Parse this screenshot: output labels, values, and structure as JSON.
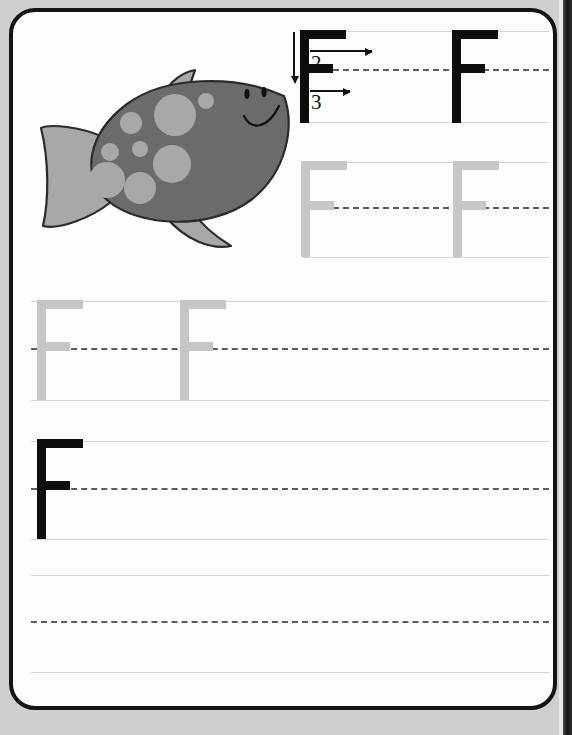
{
  "worksheet": {
    "letter": "F",
    "letter_case": "uppercase",
    "title": "Letter F tracing practice worksheet",
    "illustration": {
      "name": "fish",
      "body_color": "#6b6b6b",
      "fin_color": "#a8a8a8",
      "spot_color": "#a8a8a8",
      "outline_color": "#2b2b2b",
      "face": {
        "eyes": 2,
        "mouth": "smile"
      }
    },
    "colors": {
      "page_background": "#fdfdfd",
      "page_border": "#141414",
      "outer_background": "#cfcfcf",
      "guide_line": "#d4d4d4",
      "dashed_midline": "#5c5c5c",
      "trace_letter": "#c6c6c6",
      "model_letter": "#0d0d0d"
    },
    "stroke_order": {
      "label_1": "1",
      "label_2": "2",
      "label_3": "3",
      "stroke_1_direction": "down",
      "stroke_2_direction": "right",
      "stroke_3_direction": "right",
      "visible_numbers": [
        "2",
        "3"
      ]
    },
    "rows": [
      {
        "index": 1,
        "kind": "model",
        "top": 27,
        "mid": 65,
        "bottom": 118,
        "has_illustration_gap": true,
        "letters": [
          {
            "glyph": "F",
            "style": "black",
            "x": 296,
            "show_stroke_order": true
          },
          {
            "glyph": "F",
            "style": "black",
            "x": 448,
            "show_stroke_order": false
          }
        ]
      },
      {
        "index": 2,
        "kind": "trace",
        "top": 158,
        "mid": 203,
        "bottom": 253,
        "has_illustration_gap": true,
        "letters": [
          {
            "glyph": "F",
            "style": "gray",
            "x": 296,
            "show_stroke_order": false
          },
          {
            "glyph": "F",
            "style": "gray",
            "x": 448,
            "show_stroke_order": false
          }
        ]
      },
      {
        "index": 3,
        "kind": "trace",
        "top": 297,
        "mid": 344,
        "bottom": 396,
        "has_illustration_gap": false,
        "letters": [
          {
            "glyph": "F",
            "style": "gray",
            "x": 32,
            "show_stroke_order": false
          },
          {
            "glyph": "F",
            "style": "gray",
            "x": 175,
            "show_stroke_order": false
          }
        ]
      },
      {
        "index": 4,
        "kind": "practice",
        "top": 434,
        "mid": 481,
        "bottom": 532,
        "has_illustration_gap": false,
        "letters": [
          {
            "glyph": "F",
            "style": "black",
            "x": 32,
            "show_stroke_order": false
          }
        ]
      },
      {
        "index": 5,
        "kind": "practice",
        "top": 571,
        "mid": 617,
        "bottom": 668,
        "has_illustration_gap": false,
        "letters": []
      }
    ]
  }
}
